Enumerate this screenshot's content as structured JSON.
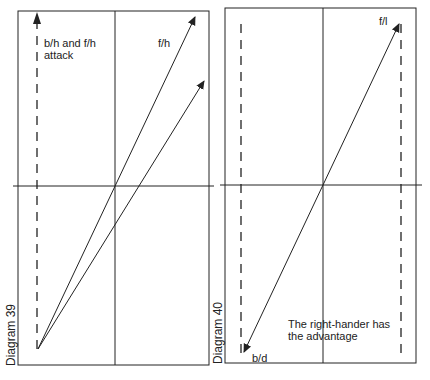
{
  "diagrams": [
    {
      "caption": "Diagram 39",
      "labels": {
        "dashed_line": "b/h and f/h\nattack",
        "arrow": "f/h"
      }
    },
    {
      "caption": "Diagram 40",
      "labels": {
        "top_arrow": "f/l",
        "bottom_arrow": "b/d",
        "note": "The right-hander has\nthe advantage"
      }
    }
  ],
  "colors": {
    "ink": "#222222",
    "background": "#ffffff"
  }
}
